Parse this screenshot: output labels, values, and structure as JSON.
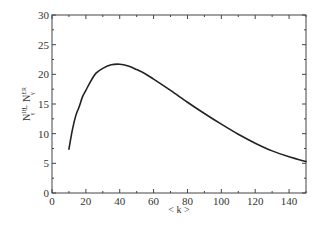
{
  "chart_data": {
    "type": "line",
    "title": "",
    "xlabel": "< k >",
    "ylabel": "N^{IH}_γ − N^{ER}_γ",
    "xlim": [
      0,
      150
    ],
    "ylim": [
      0,
      30
    ],
    "xticks": [
      0,
      20,
      40,
      60,
      80,
      100,
      120,
      140
    ],
    "yticks": [
      0,
      5,
      10,
      15,
      20,
      25,
      30
    ],
    "grid": false,
    "legend": null,
    "series": [
      {
        "name": "N^{IH}_γ − N^{ER}_γ",
        "color": "#222222",
        "x": [
          10,
          12,
          14,
          16,
          18,
          20,
          23,
          26,
          30,
          35,
          40,
          45,
          50,
          55,
          60,
          70,
          80,
          90,
          100,
          110,
          120,
          130,
          140,
          150
        ],
        "y": [
          7.4,
          10.6,
          13.0,
          14.5,
          16.2,
          17.3,
          18.9,
          20.2,
          21.0,
          21.6,
          21.7,
          21.4,
          20.8,
          20.1,
          19.2,
          17.3,
          15.3,
          13.4,
          11.6,
          9.9,
          8.4,
          7.1,
          6.1,
          5.3
        ]
      }
    ]
  },
  "labels": {
    "xlabel": "< k >",
    "ylabel_main": "N",
    "ylabel_sup1": "IH",
    "ylabel_sub1": "γ",
    "ylabel_minus": " − ",
    "ylabel_sup2": "ER",
    "ylabel_sub2": "γ"
  }
}
